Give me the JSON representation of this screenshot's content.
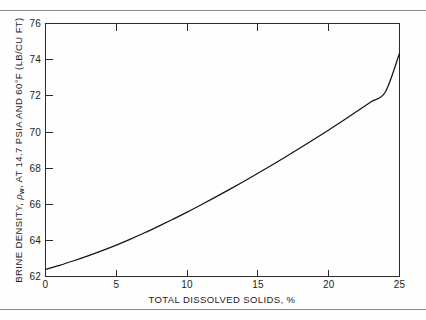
{
  "page": {
    "background_color": "#fefefe",
    "rule_color": "#8a8a8a",
    "ink_color": "#141414"
  },
  "chart_data": {
    "type": "line",
    "title": "",
    "xlabel": "TOTAL DISSOLVED SOLIDS, %",
    "ylabel": "BRINE DENSITY, ρw, AT 14.7 PSIA AND 60°F (LB/CU FT)",
    "ylabel_parts": {
      "prefix": "BRINE DENSITY,",
      "symbol": "ρ",
      "subscript": "w",
      "suffix": ", AT 14.7 PSIA AND 60°F (LB/CU FT)"
    },
    "xlim": [
      0,
      25
    ],
    "ylim": [
      62,
      76
    ],
    "xticks": [
      0,
      5,
      10,
      15,
      20,
      25
    ],
    "xticklabels": [
      "0",
      "5",
      "10",
      "15",
      "20",
      "25"
    ],
    "yticks": [
      62,
      64,
      66,
      68,
      70,
      72,
      74,
      76
    ],
    "yticklabels": [
      "62",
      "64",
      "66",
      "68",
      "70",
      "72",
      "74",
      "76"
    ],
    "grid": false,
    "legend": null,
    "tick_direction": "in",
    "frame": "full-box",
    "series": [
      {
        "name": "brine density",
        "line_color": "#141414",
        "x": [
          0,
          1,
          2,
          3,
          4,
          5,
          6,
          7,
          8,
          9,
          10,
          11,
          12,
          13,
          14,
          15,
          16,
          17,
          18,
          19,
          20,
          21,
          22,
          23,
          24,
          25
        ],
        "y": [
          62.4,
          62.62,
          62.87,
          63.14,
          63.43,
          63.74,
          64.07,
          64.42,
          64.79,
          65.17,
          65.56,
          65.97,
          66.39,
          66.82,
          67.26,
          67.71,
          68.17,
          68.64,
          69.12,
          69.61,
          70.11,
          70.62,
          71.14,
          71.67,
          72.21,
          74.35
        ]
      }
    ],
    "series_plot_points": [
      [
        0,
        62.4
      ],
      [
        0.8,
        62.57
      ],
      [
        1.6,
        62.76
      ],
      [
        2.5,
        62.99
      ],
      [
        3.5,
        63.26
      ],
      [
        4.5,
        63.56
      ],
      [
        5.5,
        63.88
      ],
      [
        6.5,
        64.22
      ],
      [
        7.5,
        64.58
      ],
      [
        8.5,
        64.95
      ],
      [
        9.5,
        65.33
      ],
      [
        10.5,
        65.72
      ],
      [
        11.5,
        66.12
      ],
      [
        12.5,
        66.53
      ],
      [
        13.5,
        66.95
      ],
      [
        14.5,
        67.38
      ],
      [
        15.5,
        67.82
      ],
      [
        16.5,
        68.27
      ],
      [
        17.5,
        68.73
      ],
      [
        18.5,
        69.2
      ],
      [
        19.5,
        69.68
      ],
      [
        20.5,
        70.17
      ],
      [
        21.5,
        70.67
      ],
      [
        22.5,
        71.18
      ],
      [
        23.5,
        71.7
      ],
      [
        24.25,
        72.1
      ],
      [
        25,
        74.35
      ]
    ]
  }
}
